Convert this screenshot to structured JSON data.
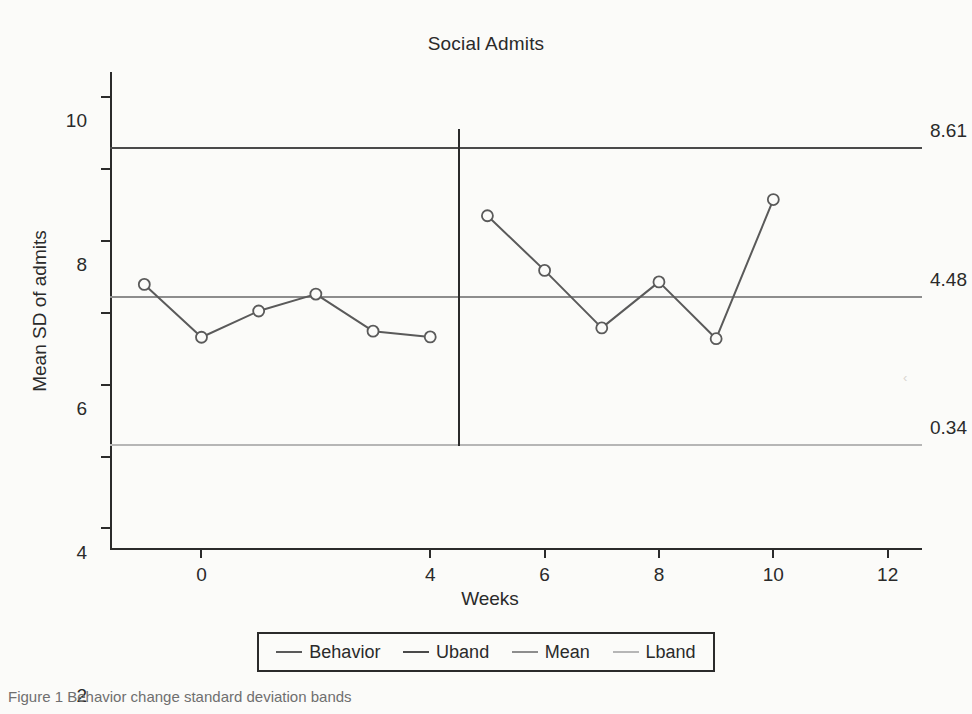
{
  "chart_data": {
    "type": "line",
    "title": "Social Admits",
    "xlabel": "Weeks",
    "ylabel": "Mean SD of admits",
    "x_tick_labels": [
      "0",
      "4",
      "6",
      "8",
      "10",
      "12"
    ],
    "x_tick_values": [
      0,
      4,
      6,
      8,
      10,
      12
    ],
    "y_tick_labels": [
      "10",
      "8",
      "6",
      "4",
      "2",
      "0",
      "−2"
    ],
    "y_tick_values": [
      10,
      8,
      6,
      4,
      2,
      0,
      -2
    ],
    "ylim": [
      -2.6,
      10.7
    ],
    "xlim": [
      -1.6,
      12.6
    ],
    "grid": false,
    "legend_position": "bottom-center",
    "series": [
      {
        "name": "Behavior",
        "color": "#5a5a5a",
        "marker": "open-circle",
        "x": [
          -1,
          0,
          1,
          2,
          3,
          4,
          5,
          6,
          7,
          8,
          9,
          10
        ],
        "values": [
          4.79,
          3.32,
          4.05,
          4.52,
          3.49,
          3.33,
          6.7,
          5.18,
          3.58,
          4.86,
          3.28,
          7.15
        ],
        "segments": [
          {
            "phase": "baseline",
            "x": [
              -1,
              0,
              1,
              2,
              3,
              4
            ],
            "values": [
              4.79,
              3.32,
              4.05,
              4.52,
              3.49,
              3.33
            ]
          },
          {
            "phase": "intervention",
            "x": [
              5,
              6,
              7,
              8,
              9,
              10
            ],
            "values": [
              6.7,
              5.18,
              3.58,
              4.86,
              3.28,
              7.15
            ]
          }
        ]
      }
    ],
    "reference_lines": [
      {
        "name": "Uband",
        "label": "8.61",
        "value": 8.61,
        "color": "#4a4a4a"
      },
      {
        "name": "Mean",
        "label": "4.48",
        "value": 4.48,
        "color": "#8d8d8d"
      },
      {
        "name": "Lband",
        "label": "0.34",
        "value": 0.34,
        "color": "#b6b6b6"
      }
    ],
    "phase_divider": {
      "name": "phase-change-line",
      "x": 4.5,
      "color": "#2b2b2b"
    },
    "legend": [
      {
        "label": "Behavior",
        "color": "#5a5a5a"
      },
      {
        "label": "Uband",
        "color": "#4a4a4a"
      },
      {
        "label": "Mean",
        "color": "#8d8d8d"
      },
      {
        "label": "Lband",
        "color": "#b6b6b6"
      }
    ]
  },
  "caption": {
    "text": "Figure 1  Behavior change standard deviation bands"
  }
}
